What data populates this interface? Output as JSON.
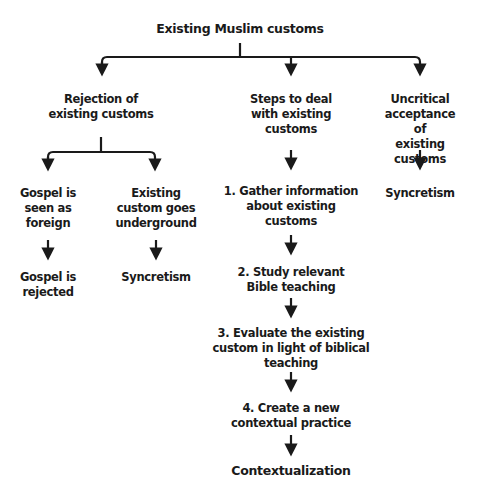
{
  "diagram": {
    "root": "Existing Muslim customs",
    "branches": [
      {
        "label": "Rejection of\nexisting customs",
        "children": [
          {
            "label": "Gospel is\nseen as\nforeign",
            "outcome": "Gospel is\nrejected"
          },
          {
            "label": "Existing\ncustom goes\nunderground",
            "outcome": "Syncretism"
          }
        ]
      },
      {
        "label": "Steps to deal\nwith existing\ncustoms",
        "steps": [
          "1. Gather information\nabout existing\ncustoms",
          "2. Study relevant\nBible teaching",
          "3. Evaluate the existing\ncustom in light of biblical\nteaching",
          "4. Create a new\ncontextual practice"
        ],
        "outcome": "Contextualization"
      },
      {
        "label": "Uncritical\nacceptance of\nexisting customs",
        "outcome": "Syncretism"
      }
    ],
    "colors": {
      "line": "#1a1a1a",
      "text": "#1a1a1a",
      "background": "#ffffff"
    }
  }
}
